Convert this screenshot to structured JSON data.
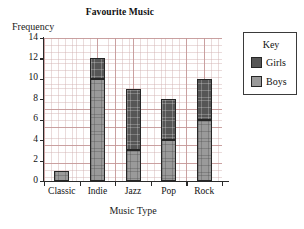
{
  "chart_data": {
    "type": "bar",
    "stacked": true,
    "title": "Favourite Music",
    "xlabel": "Music Type",
    "ylabel": "Frequency",
    "categories": [
      "Classic",
      "Indie",
      "Jazz",
      "Pop",
      "Rock"
    ],
    "series": [
      {
        "name": "Boys",
        "color": "#9a9a9a",
        "values": [
          1,
          10,
          3,
          4,
          6
        ]
      },
      {
        "name": "Girls",
        "color": "#565656",
        "values": [
          0,
          2,
          6,
          4,
          4
        ]
      }
    ],
    "totals": [
      1,
      12,
      9,
      8,
      10
    ],
    "ylim": [
      0,
      14
    ],
    "yticks": [
      0,
      2,
      4,
      6,
      8,
      10,
      12,
      14
    ],
    "ytick_labels": [
      "0",
      "2",
      "4",
      "6",
      "8",
      "10",
      "12",
      "14"
    ],
    "grid": true,
    "grid_color": "#c49696",
    "legend_position": "right-outside",
    "legend_title": "Key",
    "legend_entries": [
      {
        "label": "Girls",
        "color": "#565656"
      },
      {
        "label": "Boys",
        "color": "#9a9a9a"
      }
    ]
  }
}
